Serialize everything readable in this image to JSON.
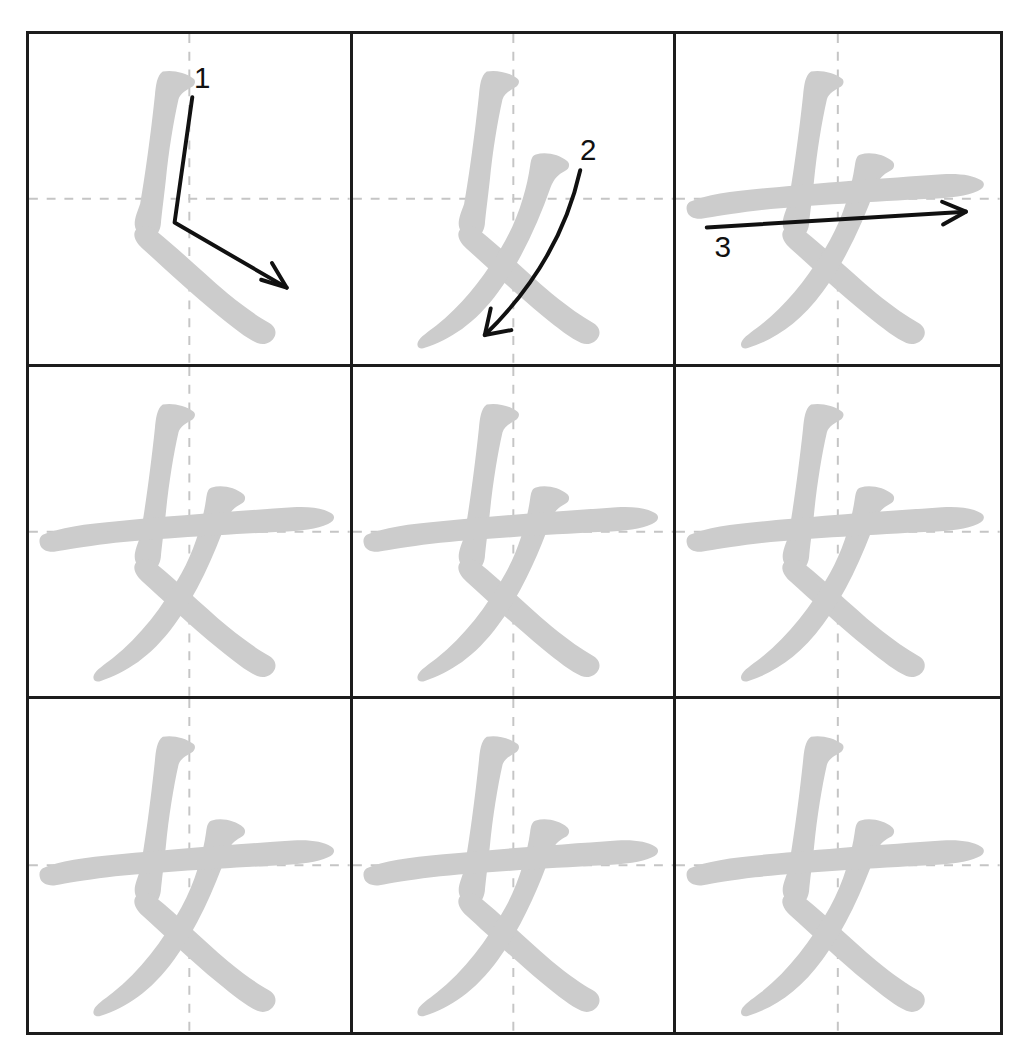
{
  "worksheet": {
    "character": "女",
    "type": "stroke-order-practice-grid",
    "rows": 3,
    "columns": 3,
    "total_strokes": 3,
    "background_color": "#ffffff",
    "grid_line_color": "#1c1c1c",
    "guideline_color": "#c5c5c5",
    "stroke_color": "#cccccc",
    "annotation_color": "#111111"
  },
  "cells": [
    {
      "id": "cell-1-1",
      "row": 1,
      "column": 1,
      "strokes_shown": 1,
      "annotation_label": "1",
      "annotation_kind": "stroke-order-arrow",
      "annotation_description": "bent vertical arrow turning down-right"
    },
    {
      "id": "cell-1-2",
      "row": 1,
      "column": 2,
      "strokes_shown": 2,
      "annotation_label": "2",
      "annotation_kind": "stroke-order-arrow",
      "annotation_description": "curved arrow sweeping down-left"
    },
    {
      "id": "cell-1-3",
      "row": 1,
      "column": 3,
      "strokes_shown": 3,
      "annotation_label": "3",
      "annotation_kind": "stroke-order-arrow",
      "annotation_description": "straight horizontal arrow to the right"
    },
    {
      "id": "cell-2-1",
      "row": 2,
      "column": 1,
      "strokes_shown": 3,
      "annotation_label": "",
      "annotation_kind": "none",
      "annotation_description": ""
    },
    {
      "id": "cell-2-2",
      "row": 2,
      "column": 2,
      "strokes_shown": 3,
      "annotation_label": "",
      "annotation_kind": "none",
      "annotation_description": ""
    },
    {
      "id": "cell-2-3",
      "row": 2,
      "column": 3,
      "strokes_shown": 3,
      "annotation_label": "",
      "annotation_kind": "none",
      "annotation_description": ""
    },
    {
      "id": "cell-3-1",
      "row": 3,
      "column": 1,
      "strokes_shown": 3,
      "annotation_label": "",
      "annotation_kind": "none",
      "annotation_description": ""
    },
    {
      "id": "cell-3-2",
      "row": 3,
      "column": 2,
      "strokes_shown": 3,
      "annotation_label": "",
      "annotation_kind": "none",
      "annotation_description": ""
    },
    {
      "id": "cell-3-3",
      "row": 3,
      "column": 3,
      "strokes_shown": 3,
      "annotation_label": "",
      "annotation_kind": "none",
      "annotation_description": ""
    }
  ]
}
